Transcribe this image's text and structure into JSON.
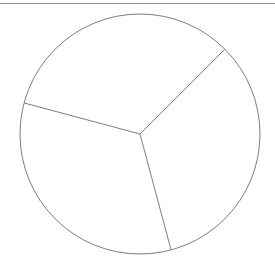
{
  "page": {
    "background_color": "#ffffff",
    "width": 275,
    "height": 264
  },
  "top_rule": {
    "name": "horizontal-rule",
    "color": "#8a8a8a",
    "thickness": 1,
    "y": 3,
    "x_start": 0,
    "x_end": 275
  },
  "figure": {
    "stroke_color": "#7d7d7d",
    "fill_color": "none",
    "stroke_width": 1,
    "center_x": 140,
    "center_y": 134,
    "radius": 120
  },
  "chart_data": {
    "type": "pie",
    "title": "",
    "subtitle": "",
    "xlabel": "",
    "ylabel": "",
    "labels": [
      "Sector 1",
      "Sector 2",
      "Sector 3"
    ],
    "values": [
      1,
      1,
      1
    ],
    "percentages": [
      33.3,
      33.3,
      33.3
    ],
    "slice_angles_deg": [
      120,
      120,
      120
    ],
    "start_angle_deg": 45,
    "direction": "clockwise",
    "filled": false,
    "outline_only": true,
    "legend": "none",
    "grid": false,
    "annotations": [],
    "divider_bearings_deg": [
      45,
      165,
      285
    ],
    "divider_endpoints": [
      {
        "name": "upper-right-radius",
        "x": 224.85,
        "y": 49.15
      },
      {
        "name": "lower-center-radius",
        "x": 140,
        "y": 254
      },
      {
        "name": "upper-left-radius",
        "x": 55.15,
        "y": 49.15
      }
    ]
  },
  "elements": {
    "circle_outline_name": "pie-circle-outline",
    "divider_names": [
      "pie-divider-upper-right",
      "pie-divider-bottom",
      "pie-divider-upper-left"
    ],
    "sector_names": [
      "pie-sector-right",
      "pie-sector-left",
      "pie-sector-top"
    ]
  }
}
